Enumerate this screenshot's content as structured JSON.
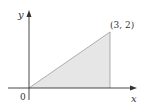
{
  "diagram": {
    "type": "region-plot",
    "axes": {
      "x_label": "x",
      "y_label": "y",
      "origin_label": "0"
    },
    "region": {
      "shape": "triangle",
      "vertices": [
        [
          0,
          0
        ],
        [
          3,
          2
        ],
        [
          3,
          0
        ]
      ],
      "fill_color": "#e6e6e6",
      "edge_color": "#9a9a9a"
    },
    "point_label": "(3, 2)",
    "colors": {
      "axis": "#333333",
      "text": "#333333",
      "background": "#ffffff"
    }
  }
}
